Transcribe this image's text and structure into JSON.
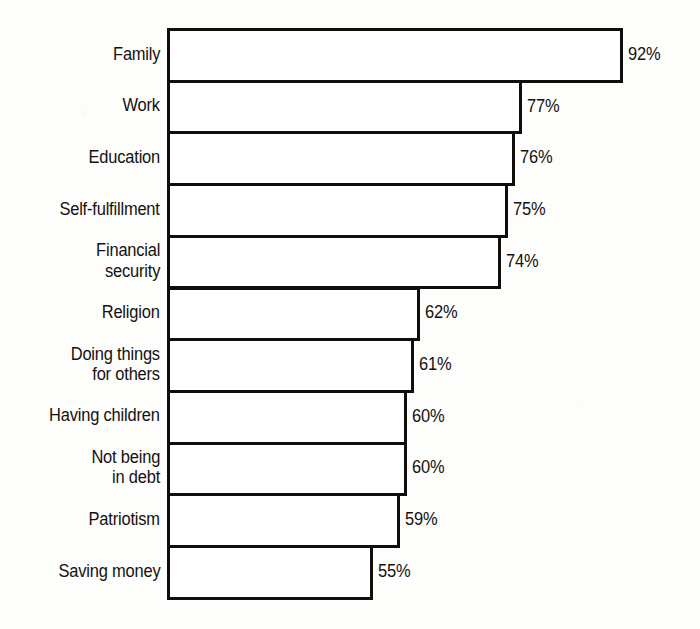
{
  "chart_data": {
    "type": "bar",
    "orientation": "horizontal",
    "title": "",
    "subtitle": "",
    "xlabel": "",
    "ylabel": "",
    "xlim": [
      0,
      100
    ],
    "grid": false,
    "legend": null,
    "value_suffix": "%",
    "categories": [
      "Family",
      "Work",
      "Education",
      "Self-fulfillment",
      "Financial security",
      "Religion",
      "Doing things for others",
      "Having children",
      "Not being in debt",
      "Patriotism",
      "Saving money"
    ],
    "values": [
      92,
      77,
      76,
      75,
      74,
      62,
      61,
      60,
      60,
      59,
      55
    ],
    "value_labels": [
      "92%",
      "77%",
      "76%",
      "75%",
      "74%",
      "62%",
      "61%",
      "60%",
      "60%",
      "59%",
      "55%"
    ],
    "category_label_lines": [
      [
        "Family"
      ],
      [
        "Work"
      ],
      [
        "Education"
      ],
      [
        "Self-fulfillment"
      ],
      [
        "Financial",
        "security"
      ],
      [
        "Religion"
      ],
      [
        "Doing things",
        "for others"
      ],
      [
        "Having children"
      ],
      [
        "Not being",
        "in debt"
      ],
      [
        "Patriotism"
      ],
      [
        "Saving money"
      ]
    ]
  },
  "style": {
    "background_color": "#fdfdfc",
    "bar_fill_color": "#ffffff",
    "bar_outline_color": "#100d0c",
    "text_color": "#14110f"
  }
}
